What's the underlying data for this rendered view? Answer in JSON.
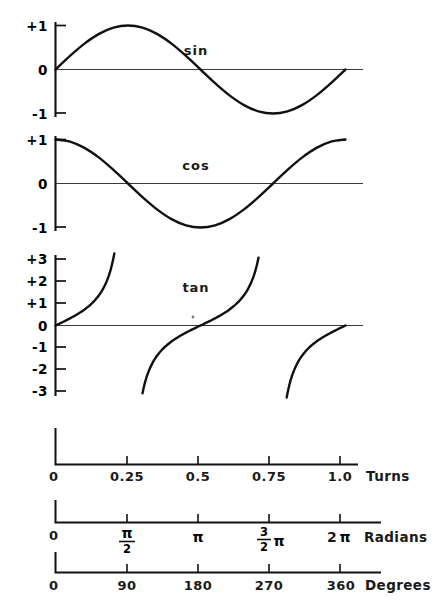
{
  "figure": {
    "background_color": "#ffffff",
    "ink_color": "#111111"
  },
  "chart_data": {
    "type": "line",
    "title": "",
    "xlabel": "",
    "ylabel": "",
    "grid": false,
    "legend": "inline-labels",
    "x_domain_turns": [
      0,
      1
    ],
    "panels": [
      {
        "name": "sin",
        "label": "sin",
        "ylim": [
          -1,
          1
        ],
        "yticks": [
          "+1",
          "0",
          "-1"
        ],
        "ytick_values": [
          1,
          0,
          -1
        ],
        "x": [
          0,
          0.05,
          0.1,
          0.15,
          0.2,
          0.25,
          0.3,
          0.35,
          0.4,
          0.45,
          0.5,
          0.55,
          0.6,
          0.65,
          0.7,
          0.75,
          0.8,
          0.85,
          0.9,
          0.95,
          1.0
        ],
        "y": [
          0.0,
          0.309,
          0.588,
          0.809,
          0.951,
          1.0,
          0.951,
          0.809,
          0.588,
          0.309,
          0.0,
          -0.309,
          -0.588,
          -0.809,
          -0.951,
          -1.0,
          -0.951,
          -0.809,
          -0.588,
          -0.309,
          0.0
        ]
      },
      {
        "name": "cos",
        "label": "cos",
        "ylim": [
          -1,
          1
        ],
        "yticks": [
          "+1",
          "0",
          "-1"
        ],
        "ytick_values": [
          1,
          0,
          -1
        ],
        "x": [
          0,
          0.05,
          0.1,
          0.15,
          0.2,
          0.25,
          0.3,
          0.35,
          0.4,
          0.45,
          0.5,
          0.55,
          0.6,
          0.65,
          0.7,
          0.75,
          0.8,
          0.85,
          0.9,
          0.95,
          1.0
        ],
        "y": [
          1.0,
          0.951,
          0.809,
          0.588,
          0.309,
          0.0,
          -0.309,
          -0.588,
          -0.809,
          -0.951,
          -1.0,
          -0.951,
          -0.809,
          -0.588,
          -0.309,
          0.0,
          0.309,
          0.588,
          0.809,
          0.951,
          1.0
        ]
      },
      {
        "name": "tan",
        "label": "tan",
        "ylim": [
          -3,
          3
        ],
        "yticks": [
          "+3",
          "+2",
          "+1",
          "0",
          "-1",
          "-2",
          "-3"
        ],
        "ytick_values": [
          3,
          2,
          1,
          0,
          -1,
          -2,
          -3
        ],
        "asymptotes_turns": [
          0.25,
          0.75
        ],
        "branches": [
          {
            "x_start": 0.0,
            "x_end": 0.25
          },
          {
            "x_start": 0.25,
            "x_end": 0.75
          },
          {
            "x_start": 0.75,
            "x_end": 1.0
          }
        ]
      }
    ],
    "scales": [
      {
        "name": "turns",
        "axis_name": "Turns",
        "ticks": [
          {
            "pos": 0.0,
            "label": "0"
          },
          {
            "pos": 0.25,
            "label": "0.25"
          },
          {
            "pos": 0.5,
            "label": "0.5"
          },
          {
            "pos": 0.75,
            "label": "0.75"
          },
          {
            "pos": 1.0,
            "label": "1.0"
          }
        ]
      },
      {
        "name": "radians",
        "axis_name": "Radians",
        "ticks": [
          {
            "pos": 0.0,
            "label": "0",
            "kind": "plain"
          },
          {
            "pos": 0.25,
            "label": "π/2",
            "kind": "fraction",
            "num": "π",
            "den": "2",
            "suffix": ""
          },
          {
            "pos": 0.5,
            "label": "π",
            "kind": "plain-pi"
          },
          {
            "pos": 0.75,
            "label": "3/2 π",
            "kind": "fraction",
            "num": "3",
            "den": "2",
            "suffix": "π"
          },
          {
            "pos": 1.0,
            "label": "2π",
            "kind": "plain-pi",
            "prefix": "2"
          }
        ]
      },
      {
        "name": "degrees",
        "axis_name": "Degrees",
        "ticks": [
          {
            "pos": 0.0,
            "label": "0"
          },
          {
            "pos": 0.25,
            "label": "90"
          },
          {
            "pos": 0.5,
            "label": "180"
          },
          {
            "pos": 0.75,
            "label": "270"
          },
          {
            "pos": 1.0,
            "label": "360"
          }
        ]
      }
    ]
  },
  "labels": {
    "sin": "sin",
    "cos": "cos",
    "tan": "tan",
    "turns": "Turns",
    "radians": "Radians",
    "degrees": "Degrees",
    "y_plus1": "+1",
    "y_zero": "0",
    "y_minus1": "-1",
    "y_plus3": "+3",
    "y_plus2": "+2",
    "y_minus2": "-2",
    "y_minus3": "-3",
    "t0": "0",
    "t025": "0.25",
    "t05": "0.5",
    "t075": "0.75",
    "t10": "1.0",
    "r0": "0",
    "r_pi": "π",
    "r_2pi_prefix": "2",
    "r_2pi_pi": "π",
    "r_half_num": "π",
    "r_half_den": "2",
    "r_three_num": "3",
    "r_three_den": "2",
    "r_three_pi": "π",
    "d0": "0",
    "d90": "90",
    "d180": "180",
    "d270": "270",
    "d360": "360"
  }
}
